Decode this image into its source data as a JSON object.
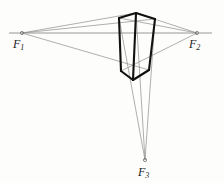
{
  "figure": {
    "background_color": "#fdfdfb",
    "width": 224,
    "height": 183,
    "border_color": "#e6e4de"
  },
  "colors": {
    "object_edge": "#111111",
    "construction_line": "#8d8d8d",
    "horizon_line": "#8d8d8d",
    "vertex_dot": "#6e6e6e",
    "label_text": "#1a1a1a"
  },
  "vanishing_points": [
    {
      "id": "F1",
      "name": "left-vanishing-point",
      "label": "F",
      "subscript": "1",
      "x": 22,
      "y": 33
    },
    {
      "id": "F2",
      "name": "right-vanishing-point",
      "label": "F",
      "subscript": "2",
      "x": 197,
      "y": 33
    },
    {
      "id": "F3",
      "name": "bottom-vanishing-point",
      "label": "F",
      "subscript": "3",
      "x": 145,
      "y": 160
    }
  ],
  "horizon": {
    "name": "horizon-line",
    "x1": 9,
    "y1": 33,
    "x2": 212,
    "y2": 33,
    "stroke_width": 0.9
  },
  "box": {
    "name": "perspective-box",
    "stroke_width": 2.1,
    "description": "Heavy-outlined rectangular block in three-point perspective",
    "vertices": {
      "top_front": {
        "x": 136,
        "y": 13
      },
      "top_left": {
        "x": 119,
        "y": 18
      },
      "top_right": {
        "x": 155,
        "y": 19
      },
      "bottom_front": {
        "x": 133,
        "y": 80
      },
      "bottom_left": {
        "x": 121,
        "y": 71
      },
      "bottom_right": {
        "x": 149,
        "y": 70
      }
    },
    "edges": [
      {
        "name": "top-left-edge",
        "from": "top_left",
        "to": "top_front"
      },
      {
        "name": "top-right-edge",
        "from": "top_front",
        "to": "top_right"
      },
      {
        "name": "vertical-front-edge",
        "from": "top_front",
        "to": "bottom_front"
      },
      {
        "name": "vertical-left-edge",
        "from": "top_left",
        "to": "bottom_left"
      },
      {
        "name": "vertical-right-edge",
        "from": "top_right",
        "to": "bottom_right"
      },
      {
        "name": "bottom-left-edge",
        "from": "bottom_left",
        "to": "bottom_front"
      },
      {
        "name": "bottom-right-edge",
        "from": "bottom_front",
        "to": "bottom_right"
      }
    ]
  },
  "construction_lines": [
    {
      "name": "f1-to-box-top-front",
      "from": "F1",
      "to_x": 136,
      "to_y": 13
    },
    {
      "name": "f1-to-box-bottom-right",
      "from": "F1",
      "to_x": 149,
      "to_y": 70
    },
    {
      "name": "f1-to-box-top-right",
      "from": "F1",
      "to_x": 155,
      "to_y": 19
    },
    {
      "name": "f2-to-box-top-front",
      "from": "F2",
      "to_x": 136,
      "to_y": 13
    },
    {
      "name": "f2-to-box-top-left",
      "from": "F2",
      "to_x": 119,
      "to_y": 18
    },
    {
      "name": "f2-to-box-bottom-left",
      "from": "F2",
      "to_x": 121,
      "to_y": 71
    },
    {
      "name": "f3-to-box-top-left",
      "from": "F3",
      "to_x": 119,
      "to_y": 18
    },
    {
      "name": "f3-to-box-top-front",
      "from": "F3",
      "to_x": 136,
      "to_y": 13
    },
    {
      "name": "f3-to-box-top-right",
      "from": "F3",
      "to_x": 155,
      "to_y": 19
    }
  ]
}
